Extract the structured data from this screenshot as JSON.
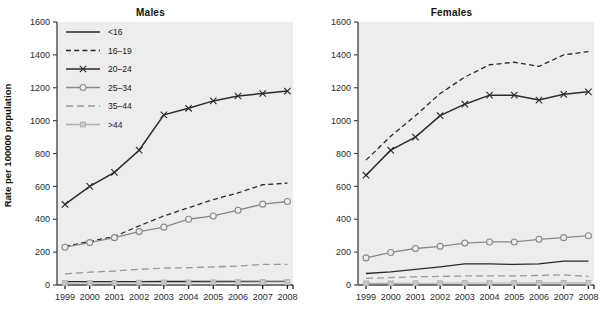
{
  "figure": {
    "ylabel": "Rate per 100000 population",
    "background": "#ffffff",
    "plot_background": "#ededed",
    "axis_color": "#4a4a4a"
  },
  "panels": [
    {
      "key": "males",
      "title": "Males",
      "has_legend": true,
      "has_ylabel": true
    },
    {
      "key": "females",
      "title": "Females",
      "has_legend": false,
      "has_ylabel": false
    }
  ],
  "legend": {
    "items": [
      {
        "label": "<16",
        "style": "solid",
        "marker": "none",
        "color": "#2b2b2b"
      },
      {
        "label": "16–19",
        "style": "dashed",
        "marker": "none",
        "color": "#2b2b2b"
      },
      {
        "label": "20–24",
        "style": "solid",
        "marker": "cross",
        "color": "#2b2b2b"
      },
      {
        "label": "25–34",
        "style": "solid",
        "marker": "circle",
        "color": "#8a8a8a"
      },
      {
        "label": "35–44",
        "style": "dashed",
        "marker": "none",
        "color": "#9a9a9a"
      },
      {
        "label": ">44",
        "style": "solid",
        "marker": "square",
        "color": "#b0b0b0"
      }
    ]
  },
  "chart_data": [
    {
      "type": "line",
      "title": "Males",
      "xlabel": "",
      "ylabel": "Rate per 100000 population",
      "x": [
        1999,
        2000,
        2001,
        2002,
        2003,
        2004,
        2005,
        2006,
        2007,
        2008
      ],
      "xticklabels": [
        "1999",
        "2000",
        "2001",
        "2002",
        "2003",
        "2004",
        "2005",
        "2006",
        "2007",
        "2008"
      ],
      "ylim": [
        0,
        1600
      ],
      "yticks": [
        0,
        200,
        400,
        600,
        800,
        1000,
        1200,
        1400,
        1600
      ],
      "grid": false,
      "legend_position": "upper left",
      "series": [
        {
          "name": "<16",
          "values": [
            20,
            20,
            20,
            20,
            22,
            22,
            22,
            22,
            22,
            22
          ]
        },
        {
          "name": "16–19",
          "values": [
            235,
            265,
            295,
            360,
            420,
            470,
            520,
            560,
            610,
            620
          ]
        },
        {
          "name": "20–24",
          "values": [
            490,
            600,
            685,
            820,
            1035,
            1075,
            1120,
            1150,
            1165,
            1180
          ]
        },
        {
          "name": "25–34",
          "values": [
            230,
            258,
            288,
            325,
            352,
            400,
            420,
            455,
            492,
            508
          ]
        },
        {
          "name": "35–44",
          "values": [
            68,
            78,
            85,
            95,
            103,
            105,
            110,
            115,
            125,
            125
          ]
        },
        {
          "name": ">44",
          "values": [
            12,
            12,
            13,
            14,
            15,
            15,
            16,
            17,
            18,
            18
          ]
        }
      ]
    },
    {
      "type": "line",
      "title": "Females",
      "xlabel": "",
      "ylabel": "",
      "x": [
        1999,
        2000,
        2001,
        2002,
        2003,
        2004,
        2005,
        2006,
        2007,
        2008
      ],
      "xticklabels": [
        "1999",
        "2000",
        "2001",
        "2002",
        "2003",
        "2004",
        "2005",
        "2006",
        "2007",
        "2008"
      ],
      "ylim": [
        0,
        1600
      ],
      "yticks": [
        0,
        200,
        400,
        600,
        800,
        1000,
        1200,
        1400,
        1600
      ],
      "grid": false,
      "legend_position": "none",
      "series": [
        {
          "name": "<16",
          "values": [
            70,
            80,
            95,
            110,
            128,
            128,
            125,
            128,
            145,
            145
          ]
        },
        {
          "name": "16–19",
          "values": [
            760,
            905,
            1030,
            1165,
            1265,
            1340,
            1355,
            1330,
            1400,
            1420
          ]
        },
        {
          "name": "20–24",
          "values": [
            668,
            820,
            900,
            1030,
            1100,
            1155,
            1155,
            1125,
            1160,
            1175
          ]
        },
        {
          "name": "25–34",
          "values": [
            165,
            198,
            222,
            235,
            255,
            262,
            262,
            278,
            288,
            300
          ]
        },
        {
          "name": "35–44",
          "values": [
            40,
            45,
            50,
            52,
            55,
            55,
            55,
            58,
            62,
            52
          ]
        },
        {
          "name": ">44",
          "values": [
            10,
            10,
            11,
            11,
            12,
            12,
            12,
            13,
            13,
            13
          ]
        }
      ]
    }
  ]
}
